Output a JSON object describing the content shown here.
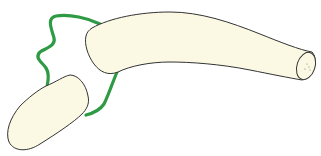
{
  "diagram": {
    "type": "anatomical-joint-illustration",
    "width": 321,
    "height": 156,
    "colors": {
      "background": "#ffffff",
      "bone_fill": "#fbf9e4",
      "bone_outline": "#333333",
      "capsule": "#2e9a44"
    },
    "parts": [
      {
        "id": "proximal-bone",
        "description": "long bone with cut end at right"
      },
      {
        "id": "distal-bone",
        "description": "short rounded bone at lower left"
      },
      {
        "id": "joint-capsule",
        "description": "green outline enclosing joint between bones"
      }
    ]
  }
}
